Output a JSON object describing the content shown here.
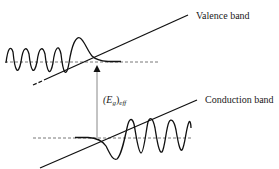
{
  "diagram": {
    "type": "band-diagram",
    "labels": {
      "valence_band": "Valence band",
      "conduction_band": "Conduction band",
      "gap_symbol": "(E",
      "gap_subscript_g": "g",
      "gap_close": ")",
      "gap_subscript_eff": "eff"
    },
    "colors": {
      "line": "#111111",
      "arrow": "#888888",
      "dashed": "#555555",
      "text": "#1a1a1a",
      "background": "#ffffff"
    }
  }
}
